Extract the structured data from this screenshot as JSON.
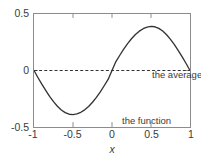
{
  "chart_data": {
    "type": "line",
    "title": "",
    "xlabel": "x",
    "ylabel": "",
    "xlim": [
      -1,
      1
    ],
    "ylim": [
      -0.5,
      0.5
    ],
    "grid": false,
    "legend": "inline-annotations",
    "xticks": [
      "-1",
      "-0.5",
      "0",
      "0.5",
      "1"
    ],
    "xtick_values": [
      -1,
      -0.5,
      0,
      0.5,
      1
    ],
    "yticks": [
      "0.5",
      "0",
      "-0.5"
    ],
    "ytick_values": [
      0.5,
      0,
      -0.5
    ],
    "series": [
      {
        "name": "the function",
        "style": "solid",
        "color": "#333333",
        "description": "smooth sine-like curve, zero at x=-1, 0 and 1; minimum about -0.39 near x=-0.57; maximum about 0.39 near x=0.57",
        "x": [
          -1.0,
          -0.95,
          -0.9,
          -0.85,
          -0.8,
          -0.75,
          -0.7,
          -0.65,
          -0.6,
          -0.55,
          -0.5,
          -0.45,
          -0.4,
          -0.35,
          -0.3,
          -0.25,
          -0.2,
          -0.15,
          -0.1,
          -0.05,
          0.0,
          0.05,
          0.1,
          0.15,
          0.2,
          0.25,
          0.3,
          0.35,
          0.4,
          0.45,
          0.5,
          0.55,
          0.6,
          0.65,
          0.7,
          0.75,
          0.8,
          0.85,
          0.9,
          0.95,
          1.0
        ],
        "y": [
          0.0,
          -0.062,
          -0.121,
          -0.176,
          -0.229,
          -0.276,
          -0.316,
          -0.349,
          -0.373,
          -0.387,
          -0.39,
          -0.384,
          -0.37,
          -0.348,
          -0.318,
          -0.281,
          -0.238,
          -0.189,
          -0.135,
          -0.079,
          0.0,
          0.079,
          0.135,
          0.189,
          0.238,
          0.281,
          0.318,
          0.348,
          0.37,
          0.384,
          0.39,
          0.387,
          0.373,
          0.349,
          0.316,
          0.276,
          0.229,
          0.176,
          0.121,
          0.062,
          0.0
        ]
      },
      {
        "name": "the average",
        "style": "dashed",
        "color": "#333333",
        "description": "horizontal dashed line at y = 0 spanning the full x range",
        "x": [
          -1.0,
          1.0
        ],
        "y": [
          0.0,
          0.0
        ]
      }
    ],
    "annotations": [
      {
        "text": "the average",
        "x": 0.08,
        "y": 0.12
      },
      {
        "text": "the function",
        "x": -0.3,
        "y": -0.28
      }
    ]
  },
  "axes": {
    "x_label": "x",
    "x_ticks": [
      {
        "label": "-1",
        "value": -1
      },
      {
        "label": "-0.5",
        "value": -0.5
      },
      {
        "label": "0",
        "value": 0
      },
      {
        "label": "0.5",
        "value": 0.5
      },
      {
        "label": "1",
        "value": 1
      }
    ],
    "y_ticks": [
      {
        "label": "0.5",
        "value": 0.5
      },
      {
        "label": "0",
        "value": 0
      },
      {
        "label": "-0.5",
        "value": -0.5
      }
    ]
  },
  "labels": {
    "average": "the average",
    "function": "the function"
  },
  "colors": {
    "curve": "#333333",
    "frame": "#8c8c8c",
    "text": "#3a3a3a",
    "background": "#ffffff"
  }
}
